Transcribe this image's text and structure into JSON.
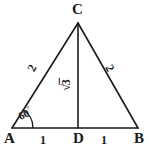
{
  "figure": {
    "type": "geometry-diagram",
    "shape": "equilateral-triangle-with-altitude",
    "background_color": "#ffffff",
    "stroke_color": "#1a1a1a"
  },
  "vertices": {
    "apex": "C",
    "left": "A",
    "right": "B",
    "foot": "D"
  },
  "sides": {
    "left_label": "2",
    "right_label": "2"
  },
  "base_segments": {
    "left_label": "1",
    "right_label": "1"
  },
  "altitude": {
    "radical_sign": "√",
    "radicand": "3",
    "label": "√3"
  },
  "angle": {
    "value": "60",
    "unit": "°",
    "label": "60°",
    "at_vertex": "A"
  }
}
